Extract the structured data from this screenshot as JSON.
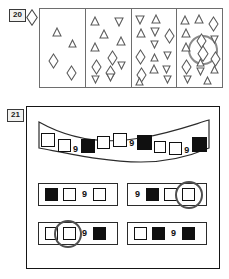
{
  "page": {
    "background": "#ffffff",
    "ink": "#101010"
  },
  "questions": [
    {
      "number": "20",
      "key_shape": "diamond",
      "panels": [
        {
          "label": "panel-1",
          "shapes": [
            {
              "type": "triangle-up",
              "x": 12,
              "y": 18,
              "size": 10
            },
            {
              "type": "triangle-up",
              "x": 28,
              "y": 30,
              "size": 9
            },
            {
              "type": "diamond",
              "x": 8,
              "y": 44,
              "size": 11
            },
            {
              "type": "diamond",
              "x": 26,
              "y": 56,
              "size": 11
            }
          ]
        },
        {
          "label": "panel-2",
          "shapes": [
            {
              "type": "triangle-up",
              "x": 4,
              "y": 7,
              "size": 10
            },
            {
              "type": "triangle-down",
              "x": 28,
              "y": 8,
              "size": 10
            },
            {
              "type": "triangle-up",
              "x": 13,
              "y": 20,
              "size": 10
            },
            {
              "type": "triangle-up",
              "x": 30,
              "y": 27,
              "size": 10
            },
            {
              "type": "triangle-up",
              "x": 4,
              "y": 33,
              "size": 10
            },
            {
              "type": "diamond",
              "x": 21,
              "y": 41,
              "size": 11
            },
            {
              "type": "diamond",
              "x": 5,
              "y": 50,
              "size": 11
            },
            {
              "type": "diamond",
              "x": 19,
              "y": 56,
              "size": 11
            },
            {
              "type": "triangle-down",
              "x": 31,
              "y": 52,
              "size": 9
            },
            {
              "type": "triangle-down",
              "x": 20,
              "y": 64,
              "size": 9
            },
            {
              "type": "triangle-down",
              "x": 5,
              "y": 66,
              "size": 9
            }
          ]
        },
        {
          "label": "panel-3",
          "shapes": [
            {
              "type": "triangle-down",
              "x": 3,
              "y": 6,
              "size": 10
            },
            {
              "type": "triangle-up",
              "x": 19,
              "y": 5,
              "size": 10
            },
            {
              "type": "triangle-up",
              "x": 4,
              "y": 19,
              "size": 10
            },
            {
              "type": "triangle-down",
              "x": 18,
              "y": 18,
              "size": 10
            },
            {
              "type": "diamond",
              "x": 32,
              "y": 19,
              "size": 11
            },
            {
              "type": "triangle-down",
              "x": 18,
              "y": 31,
              "size": 9
            },
            {
              "type": "diamond",
              "x": 3,
              "y": 40,
              "size": 11
            },
            {
              "type": "triangle-up",
              "x": 18,
              "y": 44,
              "size": 9
            },
            {
              "type": "triangle-down",
              "x": 31,
              "y": 42,
              "size": 9
            },
            {
              "type": "triangle-up",
              "x": 17,
              "y": 55,
              "size": 10
            },
            {
              "type": "diamond",
              "x": 4,
              "y": 58,
              "size": 11
            },
            {
              "type": "triangle-down",
              "x": 30,
              "y": 56,
              "size": 9
            },
            {
              "type": "triangle-up",
              "x": 3,
              "y": 68,
              "size": 9
            },
            {
              "type": "triangle-down",
              "x": 31,
              "y": 66,
              "size": 9
            }
          ]
        },
        {
          "label": "panel-4",
          "circled_shape": "diamond",
          "shapes": [
            {
              "type": "triangle-up",
              "x": 3,
              "y": 6,
              "size": 10
            },
            {
              "type": "triangle-up",
              "x": 17,
              "y": 5,
              "size": 10
            },
            {
              "type": "diamond",
              "x": 31,
              "y": 7,
              "size": 11
            },
            {
              "type": "triangle-up",
              "x": 4,
              "y": 19,
              "size": 10
            },
            {
              "type": "diamond",
              "x": 19,
              "y": 24,
              "size": 11
            },
            {
              "type": "triangle-down",
              "x": 33,
              "y": 26,
              "size": 9
            },
            {
              "type": "triangle-up",
              "x": 4,
              "y": 33,
              "size": 10
            },
            {
              "type": "diamond",
              "x": 20,
              "y": 36,
              "size": 12
            },
            {
              "type": "diamond",
              "x": 33,
              "y": 42,
              "size": 11
            },
            {
              "type": "triangle-up",
              "x": 19,
              "y": 49,
              "size": 9
            },
            {
              "type": "diamond",
              "x": 4,
              "y": 50,
              "size": 11
            },
            {
              "type": "triangle-down",
              "x": 19,
              "y": 58,
              "size": 9
            },
            {
              "type": "triangle-up",
              "x": 33,
              "y": 56,
              "size": 9
            },
            {
              "type": "triangle-down",
              "x": 6,
              "y": 66,
              "size": 9
            },
            {
              "type": "triangle-up",
              "x": 26,
              "y": 67,
              "size": 9
            }
          ]
        }
      ]
    },
    {
      "number": "21",
      "banner": {
        "shape": "wavy-ribbon",
        "sequence": [
          {
            "kind": "square",
            "fill": "white"
          },
          {
            "kind": "square",
            "fill": "white"
          },
          {
            "kind": "numeral",
            "text": "9"
          },
          {
            "kind": "square",
            "fill": "black"
          },
          {
            "kind": "square",
            "fill": "white"
          },
          {
            "kind": "square",
            "fill": "white"
          },
          {
            "kind": "numeral",
            "text": "9"
          },
          {
            "kind": "square",
            "fill": "black"
          },
          {
            "kind": "square",
            "fill": "white"
          },
          {
            "kind": "square",
            "fill": "white"
          },
          {
            "kind": "numeral",
            "text": "9"
          },
          {
            "kind": "square",
            "fill": "black"
          }
        ]
      },
      "options": [
        {
          "id": "a",
          "circled": false,
          "items": [
            {
              "kind": "square",
              "fill": "black"
            },
            {
              "kind": "square",
              "fill": "white"
            },
            {
              "kind": "numeral",
              "text": "9"
            },
            {
              "kind": "square",
              "fill": "white"
            }
          ]
        },
        {
          "id": "b",
          "circled": true,
          "items": [
            {
              "kind": "numeral",
              "text": "9"
            },
            {
              "kind": "square",
              "fill": "black"
            },
            {
              "kind": "square",
              "fill": "white"
            },
            {
              "kind": "square",
              "fill": "white"
            }
          ]
        },
        {
          "id": "c",
          "circled": true,
          "items": [
            {
              "kind": "square",
              "fill": "white"
            },
            {
              "kind": "square",
              "fill": "white"
            },
            {
              "kind": "numeral",
              "text": "9"
            },
            {
              "kind": "square",
              "fill": "black"
            }
          ]
        },
        {
          "id": "d",
          "circled": false,
          "items": [
            {
              "kind": "square",
              "fill": "white"
            },
            {
              "kind": "square",
              "fill": "black"
            },
            {
              "kind": "numeral",
              "text": "9"
            },
            {
              "kind": "square",
              "fill": "black"
            }
          ]
        }
      ]
    }
  ]
}
